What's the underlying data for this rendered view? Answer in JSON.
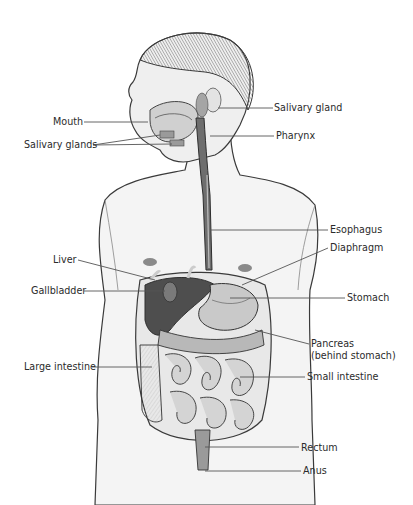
{
  "diagram": {
    "colors": {
      "background": "#ffffff",
      "label_text": "#2b2b2b",
      "leader_line": "#555555",
      "outline": "#3a3a3a",
      "skin": "#f2f2f2",
      "organ_dark": "#4a4a4a",
      "organ_mid": "#9a9a9a",
      "organ_light": "#d8d8d8"
    },
    "labels_left": [
      {
        "id": "mouth",
        "text": "Mouth",
        "x": 53,
        "y": 117,
        "line_to": [
          143,
          122
        ]
      },
      {
        "id": "salivary-glands",
        "text": "Salivary glands",
        "x": 24,
        "y": 139,
        "line_to": [
          158,
          135
        ],
        "line_to2": [
          170,
          144
        ]
      },
      {
        "id": "liver",
        "text": "Liver",
        "x": 53,
        "y": 255,
        "line_to": [
          155,
          280
        ]
      },
      {
        "id": "gallbladder",
        "text": "Gallbladder",
        "x": 31,
        "y": 286,
        "line_to": [
          160,
          291
        ]
      },
      {
        "id": "large-intestine",
        "text": "Large intestine",
        "x": 24,
        "y": 362,
        "line_to": [
          150,
          367
        ]
      }
    ],
    "labels_right": [
      {
        "id": "salivary-gland",
        "text": "Salivary gland",
        "x": 274,
        "y": 103,
        "line_from": [
          218,
          108
        ]
      },
      {
        "id": "pharynx",
        "text": "Pharynx",
        "x": 276,
        "y": 131,
        "line_from": [
          210,
          136
        ]
      },
      {
        "id": "esophagus",
        "text": "Esophagus",
        "x": 330,
        "y": 225,
        "line_from": [
          218,
          230
        ]
      },
      {
        "id": "diaphragm",
        "text": "Diaphragm",
        "x": 330,
        "y": 243,
        "line_from": [
          242,
          285
        ]
      },
      {
        "id": "stomach",
        "text": "Stomach",
        "x": 347,
        "y": 293,
        "line_from": [
          230,
          298
        ]
      },
      {
        "id": "pancreas",
        "text": "Pancreas\n(behind stomach)",
        "line1": "Pancreas",
        "line2": "(behind stomach)",
        "x": 311,
        "y": 339,
        "line_from": [
          255,
          330
        ]
      },
      {
        "id": "small-intestine",
        "text": "Small intestine",
        "x": 307,
        "y": 372,
        "line_from": [
          240,
          377
        ]
      },
      {
        "id": "rectum",
        "text": "Rectum",
        "x": 301,
        "y": 443,
        "line_from": [
          200,
          447
        ]
      },
      {
        "id": "anus",
        "text": "Anus",
        "x": 303,
        "y": 466,
        "line_from": [
          200,
          471
        ]
      }
    ]
  }
}
